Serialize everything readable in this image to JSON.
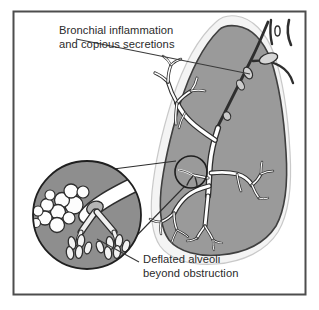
{
  "figure": {
    "frame": {
      "border_color": "#4d4d4d",
      "background_color": "#ffffff"
    },
    "colors": {
      "lung_fill": "#9a9a9a",
      "lung_outline": "#3a3a3a",
      "lung_highlight": "#f2f2f2",
      "airway_fill": "#ffffff",
      "airway_outline": "#2e2e2e",
      "secretion_fill": "#d0d0d0",
      "inset_fill": "#8e8e8e",
      "inset_outline": "#2e2e2e",
      "bubble_fill": "#fdfdfd",
      "mucus_plug_fill": "#b8b8b8",
      "alveoli_fill": "#f5f5f5",
      "leader_line": "#3a3a3a",
      "text_color": "#2b2b2b"
    },
    "labels": [
      {
        "id": "bronchial-inflammation-label",
        "lines": [
          "Bronchial inflammation",
          "and copious secretions"
        ],
        "anchor": "start",
        "x": 59,
        "y": 34,
        "line_height": 14
      },
      {
        "id": "deflated-alveoli-label",
        "lines": [
          "Deflated alveoli",
          "beyond obstruction"
        ],
        "anchor": "start",
        "x": 143,
        "y": 263,
        "line_height": 14
      }
    ],
    "leader_lines": [
      {
        "id": "leader-to-secretions",
        "from": [
          76,
          39
        ],
        "to": [
          250,
          74
        ]
      },
      {
        "id": "leader-to-alveoli",
        "from": [
          139,
          262
        ],
        "to": [
          97,
          239
        ]
      }
    ],
    "structures": {
      "lung": "right lung, coronal silhouette, shaded gray",
      "trachea_stub": "cut trachea with cartilage rings at upper right",
      "main_bronchus": "dark bronchus entering lung from upper right hilum",
      "bronchial_tree": "white branching airway tree inside lung",
      "secretion_blobs": "light gray oval mucus collections along bronchus",
      "magnifier_circle": "small circle marking the magnified region on a distal bronchiole",
      "inset_circle": "large magnified circular inset at lower left",
      "inset_contents": "obstructed bronchiole with mucus plug, copious bubbly secretions, and deflated alveolar clusters"
    },
    "inset": {
      "center_x": 87,
      "center_y": 215,
      "radius": 55
    },
    "magnifier": {
      "center_x": 191,
      "center_y": 172,
      "radius": 16
    }
  }
}
